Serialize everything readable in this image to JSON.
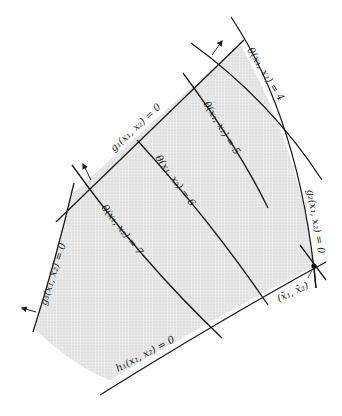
{
  "diagram": {
    "type": "constrained-optimization-feasible-region",
    "colors": {
      "background": "#ffffff",
      "feasible_region": "#e4e4e4",
      "lines": "#1a1a1a",
      "text": "#222222"
    },
    "constraints": [
      {
        "id": "g1",
        "label": "g1(x1, x2) = 0",
        "text": "g₁(x₁, x₂) = 0"
      },
      {
        "id": "g2",
        "label": "g2(x1, x2) = 0",
        "text": "g₂(x₁, x₂) = 0"
      },
      {
        "id": "g3",
        "label": "g3(x1, x2) = 0",
        "text": "g₃(x₁, x₂) = 0"
      },
      {
        "id": "h1",
        "label": "h1(x1, x2) = 0",
        "text": "h₁(x₁, x₂) = 0"
      }
    ],
    "objective_contours": [
      {
        "value": 4,
        "text": "θ(x₁, x₂) = 4"
      },
      {
        "value": 5,
        "text": "θ(x₁, x₂) = 5"
      },
      {
        "value": 6,
        "text": "θ(x₁, x₂) = 6"
      },
      {
        "value": 7,
        "text": "θ(x₁, x₂) = 7"
      }
    ],
    "optimum": {
      "text": "(x̄₁, x̄₂)"
    }
  }
}
